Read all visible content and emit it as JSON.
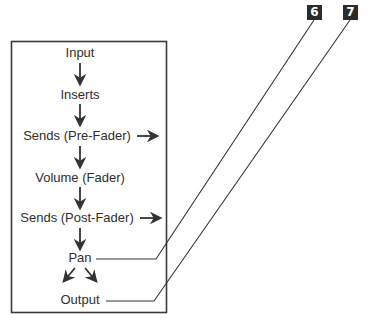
{
  "diagram": {
    "stages": [
      {
        "id": "input",
        "label": "Input",
        "x": 80,
        "y": 53
      },
      {
        "id": "inserts",
        "label": "Inserts",
        "x": 80,
        "y": 95
      },
      {
        "id": "sends-pre-fader",
        "label": "Sends (Pre-Fader)",
        "x": 77,
        "y": 136,
        "side_arrow": true
      },
      {
        "id": "volume-fader",
        "label": "Volume (Fader)",
        "x": 80,
        "y": 178
      },
      {
        "id": "sends-post-fader",
        "label": "Sends (Post-Fader)",
        "x": 78,
        "y": 218,
        "side_arrow": true
      },
      {
        "id": "pan",
        "label": "Pan",
        "x": 80,
        "y": 258
      },
      {
        "id": "output",
        "label": "Output",
        "x": 80,
        "y": 300
      }
    ],
    "flow": [
      {
        "from": "input",
        "to": "inserts",
        "type": "down"
      },
      {
        "from": "inserts",
        "to": "sends-pre-fader",
        "type": "down"
      },
      {
        "from": "sends-pre-fader",
        "to": "volume-fader",
        "type": "down"
      },
      {
        "from": "volume-fader",
        "to": "sends-post-fader",
        "type": "down"
      },
      {
        "from": "sends-post-fader",
        "to": "pan",
        "type": "down"
      },
      {
        "from": "pan",
        "to": "output",
        "type": "split-left-right"
      }
    ],
    "callouts": [
      {
        "number": "6",
        "points_to": "pan"
      },
      {
        "number": "7",
        "points_to": "output"
      }
    ],
    "colors": {
      "line": "#333333",
      "callout_bg": "#2b2b2b",
      "callout_text": "#ffffff",
      "text": "#2e2e2e",
      "background": "#ffffff"
    }
  }
}
